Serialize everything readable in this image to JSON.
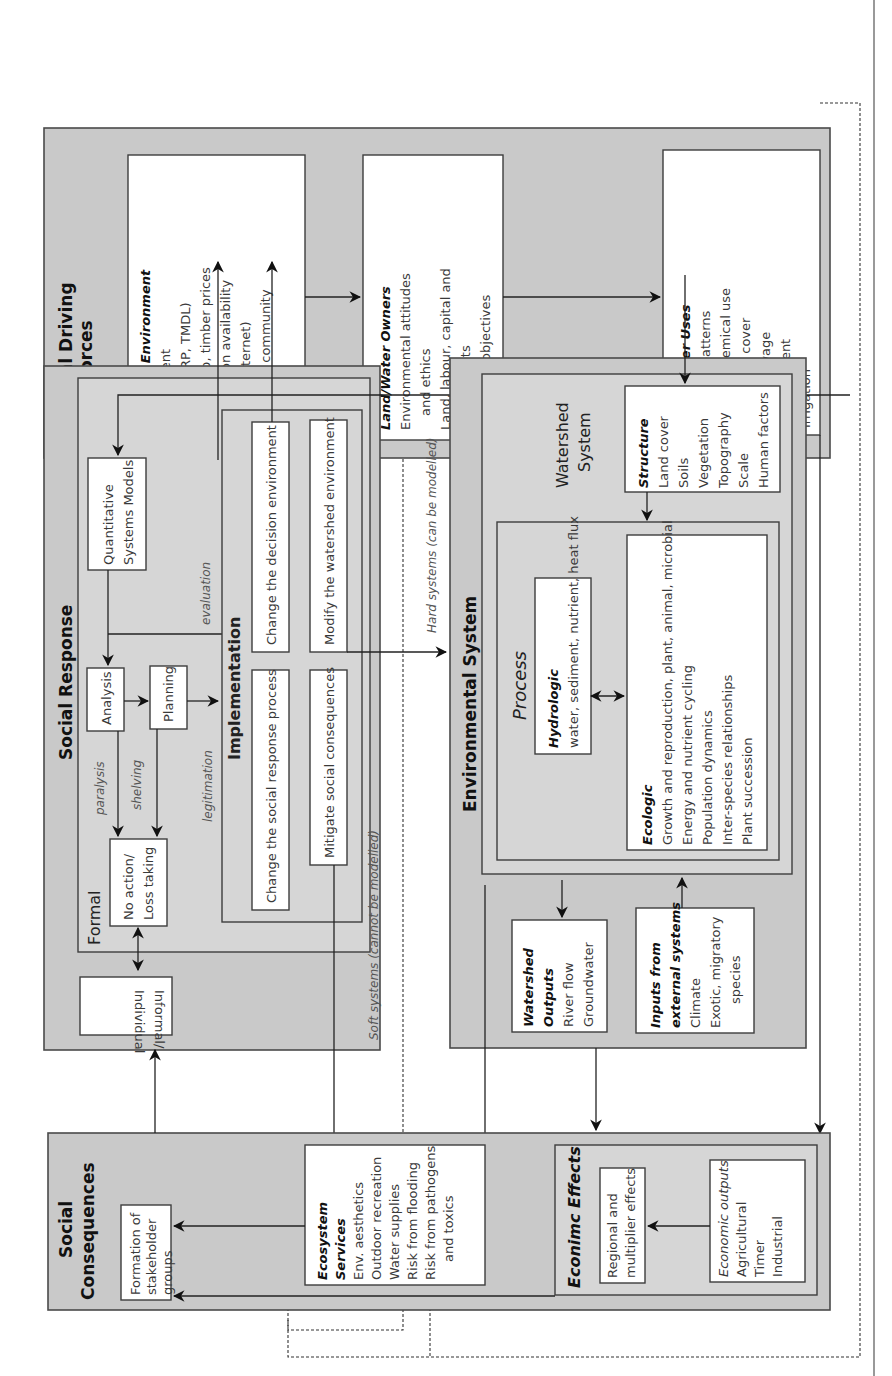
{
  "social_driving_forces": {
    "title_line1": "Social Driving",
    "title_line2": "Forces",
    "decision_environment": {
      "heading": "Decision Environment",
      "lines": [
        "Government",
        "(e.g., CRP, TMDL)",
        "Land, crop, timber prices",
        "Information availability",
        "(e.g., Internet)",
        "Perceived community",
        "values"
      ]
    },
    "land_water_owners": {
      "heading": "Land/Water Owners",
      "lines": [
        "Environmental attitudes",
        "and ethics",
        "Land, labour, capital and",
        "skill assets",
        "Goals and objectives"
      ]
    },
    "land_water_uses": {
      "heading": "Land/Water Uses",
      "lines": [
        "Cropping patterns",
        "Tilllage, chemical use",
        "Vegetation cover",
        "Water, sewage",
        "treatment",
        "Irrigation"
      ]
    }
  },
  "social_response": {
    "title": "Social Response",
    "formal_label": "Formal",
    "quantitative_models": [
      "Quantitative",
      "Systems Models"
    ],
    "analysis": "Analysis",
    "planning": "Planning",
    "implementation": {
      "title": "Implementation",
      "items": [
        "Change the decision environment",
        "Modify the watershed environment",
        "Change the social response process",
        "Mitigate social consequences"
      ]
    },
    "no_action": [
      "No action/",
      "Loss taking"
    ],
    "informal": [
      "Informal/",
      "Individual"
    ],
    "edge_labels": {
      "evaluation": "evaluation",
      "paralysis": "paralysis",
      "shelving": "shelving",
      "legitimation": "legitimation"
    }
  },
  "environmental_system": {
    "title": "Environmental System",
    "watershed_title": [
      "Watershed",
      "System"
    ],
    "structure": {
      "heading": "Structure",
      "lines": [
        "Land cover",
        "Soils",
        "Vegetation",
        "Topography",
        "Scale",
        "Human factors"
      ]
    },
    "process_title": "Process",
    "hydrologic": {
      "heading": "Hydrologic",
      "lines": [
        "water, sediment, nutrient, heat flux"
      ]
    },
    "ecologic": {
      "heading": "Ecologic",
      "lines": [
        "Growth and reproduction, plant, animal, microbial",
        "Energy and nutrient cycling",
        "Population dynamics",
        "Inter-species relationships",
        "Plant succession"
      ]
    },
    "watershed_outputs": {
      "heading": [
        "Watershed",
        "Outputs"
      ],
      "lines": [
        "River flow",
        "Groundwater"
      ]
    },
    "external_inputs": {
      "heading": [
        "Inputs from",
        "external systems"
      ],
      "lines": [
        "Climate",
        "Exotic, migratory",
        "species"
      ]
    }
  },
  "social_consequences": {
    "title_line1": "Social",
    "title_line2": "Consequences",
    "stakeholder_groups": [
      "Formation of",
      "stakeholder",
      "groups"
    ],
    "ecosystem_services": {
      "heading": [
        "Ecosystem",
        "Services"
      ],
      "lines": [
        "Env. aesthetics",
        "Outdoor recreation",
        "Water supplies",
        "Risk from flooding",
        "Risk from pathogens",
        "and toxics"
      ]
    },
    "economic_effects": {
      "title": "Econimc Effects",
      "regional": [
        "Regional and",
        "multiplier effects"
      ],
      "outputs_heading": "Economic outputs",
      "outputs_lines": [
        "Agricultural",
        "Timer",
        "Industrial"
      ]
    }
  },
  "boundary_labels": {
    "soft": "Soft systems (cannot be modelled)",
    "hard": "Hard systems (can be modelled)"
  }
}
